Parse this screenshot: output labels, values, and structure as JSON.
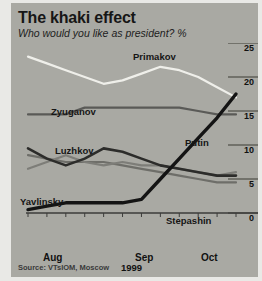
{
  "header": {
    "title": "The khaki effect",
    "subtitle": "Who would you like as president? %"
  },
  "source": "Source: VTsIOM, Moscow",
  "axis": {
    "y_ticks": [
      "25",
      "20",
      "15",
      "10",
      "5",
      "0"
    ],
    "x_ticks": [
      "Aug",
      "Sep",
      "Oct"
    ],
    "year": "1999"
  },
  "series_labels": {
    "primakov": "Primakov",
    "zyuganov": "Zyuganov",
    "luzhkov": "Luzhkov",
    "yavlinsky": "Yavlinsky",
    "stepashin": "Stepashin",
    "putin": "Putin"
  },
  "colors": {
    "background": "#a9a9a3",
    "page": "#e9e9e6",
    "primakov": "#efefea",
    "zyuganov": "#5a5a57",
    "luzhkov": "#2c2c2a",
    "yavlinsky": "#7d7d78",
    "stepashin": "#6e6e69",
    "putin": "#141414",
    "axis": "#3c3c3a"
  },
  "chart_data": {
    "type": "line",
    "title": "The khaki effect",
    "subtitle": "Who would you like as president? %",
    "xlabel": "1999",
    "ylabel": "%",
    "ylim": [
      0,
      25
    ],
    "yticks": [
      0,
      5,
      10,
      15,
      20,
      25
    ],
    "grid": false,
    "legend": "inline-labels",
    "source": "Source: VTsIOM, Moscow",
    "x": [
      "Aug 1",
      "Aug 8",
      "Aug 15",
      "Aug 22",
      "Aug 29",
      "Sep 5",
      "Sep 12",
      "Sep 19",
      "Sep 26",
      "Oct 3",
      "Oct 10",
      "Oct 17"
    ],
    "x_tick_labels": [
      "Aug",
      "Sep",
      "Oct"
    ],
    "series": [
      {
        "name": "Primakov",
        "color": "#efefea",
        "values": [
          23.0,
          22.0,
          21.0,
          20.0,
          19.0,
          19.5,
          20.5,
          21.5,
          21.0,
          20.0,
          18.5,
          17.0
        ]
      },
      {
        "name": "Zyuganov",
        "color": "#5a5a57",
        "values": [
          14.5,
          14.5,
          14.5,
          15.5,
          15.5,
          15.5,
          15.5,
          15.5,
          15.5,
          15.0,
          14.5,
          14.5
        ]
      },
      {
        "name": "Luzhkov",
        "color": "#2c2c2a",
        "values": [
          9.5,
          8.0,
          7.0,
          8.0,
          9.5,
          9.0,
          8.0,
          7.0,
          6.5,
          6.0,
          5.5,
          5.5
        ]
      },
      {
        "name": "Yavlinsky",
        "color": "#7d7d78",
        "values": [
          6.5,
          7.5,
          8.5,
          7.5,
          7.0,
          7.5,
          7.0,
          7.0,
          6.5,
          6.0,
          5.5,
          6.0
        ]
      },
      {
        "name": "Stepashin",
        "color": "#6e6e69",
        "values": [
          8.5,
          8.0,
          7.5,
          7.5,
          7.5,
          7.0,
          6.5,
          6.0,
          5.5,
          5.0,
          4.5,
          4.5
        ]
      },
      {
        "name": "Putin",
        "color": "#141414",
        "values": [
          0.5,
          1.0,
          1.5,
          1.5,
          1.5,
          1.5,
          2.0,
          5.0,
          8.0,
          11.0,
          14.0,
          17.5
        ]
      }
    ]
  }
}
